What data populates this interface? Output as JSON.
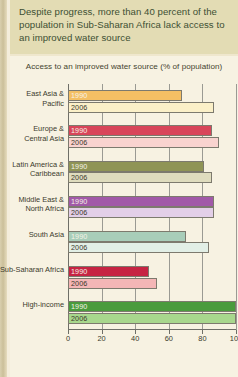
{
  "callout": {
    "text": "Despite progress, more than 40 percent of the population in Sub-Saharan Africa lack access to an improved water source"
  },
  "chart_data": {
    "type": "bar",
    "orientation": "horizontal",
    "title": "Access to an improved water source (% of population)",
    "subtitle": "",
    "xlabel": "",
    "ylabel": "",
    "xlim": [
      0,
      100
    ],
    "xticks": [
      0,
      20,
      40,
      60,
      80,
      100
    ],
    "xticklabels": [
      "0",
      "20",
      "40",
      "60",
      "80",
      "100"
    ],
    "grid": true,
    "legend": "inline-bar-labels",
    "categories": [
      "East Asia & Pacific",
      "Europe & Central Asia",
      "Latin America & Caribbean",
      "Middle East & North Africa",
      "South Asia",
      "Sub-Saharan Africa",
      "High-income"
    ],
    "series": [
      {
        "name": "1990",
        "values": [
          68,
          86,
          81,
          87,
          70,
          48,
          100
        ]
      },
      {
        "name": "2006",
        "values": [
          87,
          90,
          86,
          87,
          84,
          53,
          100
        ]
      }
    ],
    "group_colors": [
      {
        "category": "East Asia & Pacific",
        "1990": "#f4bf64",
        "2006": "#fbf0c8"
      },
      {
        "category": "Europe & Central Asia",
        "1990": "#d8455a",
        "2006": "#f9d3cf"
      },
      {
        "category": "Latin America & Caribbean",
        "1990": "#8f9455",
        "2006": "#dfdcbe"
      },
      {
        "category": "Middle East & North Africa",
        "1990": "#a159a8",
        "2006": "#e3cfe8"
      },
      {
        "category": "South Asia",
        "1990": "#a8cdb9",
        "2006": "#e2efe6"
      },
      {
        "category": "Sub-Saharan Africa",
        "1990": "#c62443",
        "2006": "#f4b6b6"
      },
      {
        "category": "High-income",
        "1990": "#4a9b3d",
        "2006": "#a8d78d"
      }
    ]
  },
  "palette": {
    "page_background": "#efe7cd",
    "callout_background": "#e3dcb4",
    "callout_text": "#3d4f33",
    "panel_background": "#f7f2e2",
    "axis": "#6f6f68",
    "gridline": "#9a9a93",
    "tick_text": "#3b3a2c"
  }
}
